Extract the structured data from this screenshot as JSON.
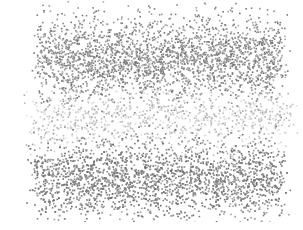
{
  "figure": {
    "type": "point-cloud-render",
    "background": "#ffffff",
    "point_color_dense": "#6e6e6e",
    "point_color_sparse": "#b5b5b5",
    "bands": [
      {
        "name": "top-band",
        "cx": 160,
        "cy": 58,
        "rx": 130,
        "ry": 42,
        "count": 2600,
        "shade": 0.55
      },
      {
        "name": "middle-band",
        "cx": 160,
        "cy": 118,
        "rx": 140,
        "ry": 30,
        "count": 900,
        "shade": 0.78
      },
      {
        "name": "bottom-band",
        "cx": 158,
        "cy": 178,
        "rx": 132,
        "ry": 38,
        "count": 2600,
        "shade": 0.52
      }
    ]
  },
  "caption": {
    "text": ""
  }
}
